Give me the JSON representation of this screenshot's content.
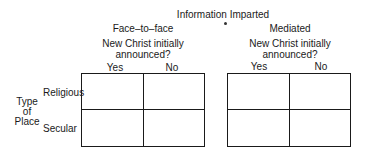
{
  "title": "Information Imparted",
  "groups": [
    {
      "label": "Face–to–face",
      "question_line1": "New Christ initially",
      "question_line2": "announced?",
      "columns": [
        "Yes",
        "No"
      ]
    },
    {
      "label": "Mediated",
      "question_line1": "New Christ initially",
      "question_line2": "announced?",
      "columns": [
        "Yes",
        "No"
      ]
    }
  ],
  "row_axis": {
    "line1": "Type",
    "line2": "of",
    "line3": "Place"
  },
  "rows": [
    "Religious",
    "Secular"
  ]
}
